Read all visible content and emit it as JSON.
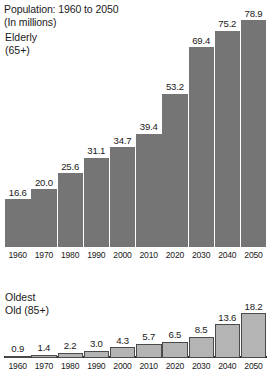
{
  "header": {
    "line1": "Population: 1960 to 2050",
    "line2": "(In millions)"
  },
  "panels": {
    "elderly": {
      "line1": "Elderly",
      "line2": "(65+)"
    },
    "oldest": {
      "line1": "Oldest",
      "line2": "Old (85+)"
    }
  },
  "footer": {
    "source_partial": ""
  },
  "colors": {
    "background": "#ffffff",
    "bar_elderly": "#757575",
    "bar_oldest": "#b4b4b4",
    "bar_oldest_outline": "#4a4a4a",
    "axis": "#2b2b2b",
    "text": "#1a1a1a"
  },
  "chart_data": [
    {
      "type": "bar",
      "title": "Population: 1960 to 2050 (In millions) — Elderly (65+)",
      "series_name": "Elderly (65+)",
      "xlabel": "",
      "ylabel": "",
      "ylim": [
        0,
        78.9
      ],
      "grid": false,
      "legend": "none",
      "categories": [
        "1960",
        "1970",
        "1980",
        "1990",
        "2000",
        "2010",
        "2020",
        "2030",
        "2040",
        "2050"
      ],
      "values": [
        16.6,
        20.0,
        25.6,
        31.1,
        34.7,
        39.4,
        53.2,
        69.4,
        75.2,
        78.9
      ],
      "value_labels": [
        "16.6",
        "20.0",
        "25.6",
        "31.1",
        "34.7",
        "39.4",
        "53.2",
        "69.4",
        "75.2",
        "78.9"
      ]
    },
    {
      "type": "bar",
      "title": "Oldest Old (85+)",
      "series_name": "Oldest Old (85+)",
      "xlabel": "",
      "ylabel": "",
      "ylim": [
        0,
        18.2
      ],
      "grid": false,
      "legend": "none",
      "categories": [
        "1960",
        "1970",
        "1980",
        "1990",
        "2000",
        "2010",
        "2020",
        "2030",
        "2040",
        "2050"
      ],
      "values": [
        0.9,
        1.4,
        2.2,
        3.0,
        4.3,
        5.7,
        6.5,
        8.5,
        13.6,
        18.2
      ],
      "value_labels": [
        "0.9",
        "1.4",
        "2.2",
        "3.0",
        "4.3",
        "5.7",
        "6.5",
        "8.5",
        "13.6",
        "18.2"
      ]
    }
  ]
}
